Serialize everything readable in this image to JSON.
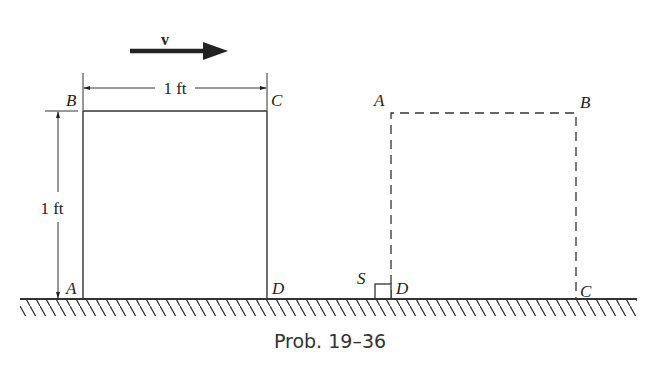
{
  "figure": {
    "caption": "Prob. 19–36",
    "velocity_label": "v",
    "width_dimension": "1 ft",
    "height_dimension": "1 ft",
    "initial_square": {
      "corners": {
        "top_left": "B",
        "top_right": "C",
        "bottom_left": "A",
        "bottom_right": "D"
      },
      "style": "solid"
    },
    "final_square": {
      "corners": {
        "top_left": "A",
        "top_right": "B",
        "bottom_left": "D",
        "bottom_right": "C"
      },
      "style": "dashed"
    },
    "stop_label": "S",
    "colors": {
      "ink": "#222222",
      "background": "#ffffff"
    }
  }
}
